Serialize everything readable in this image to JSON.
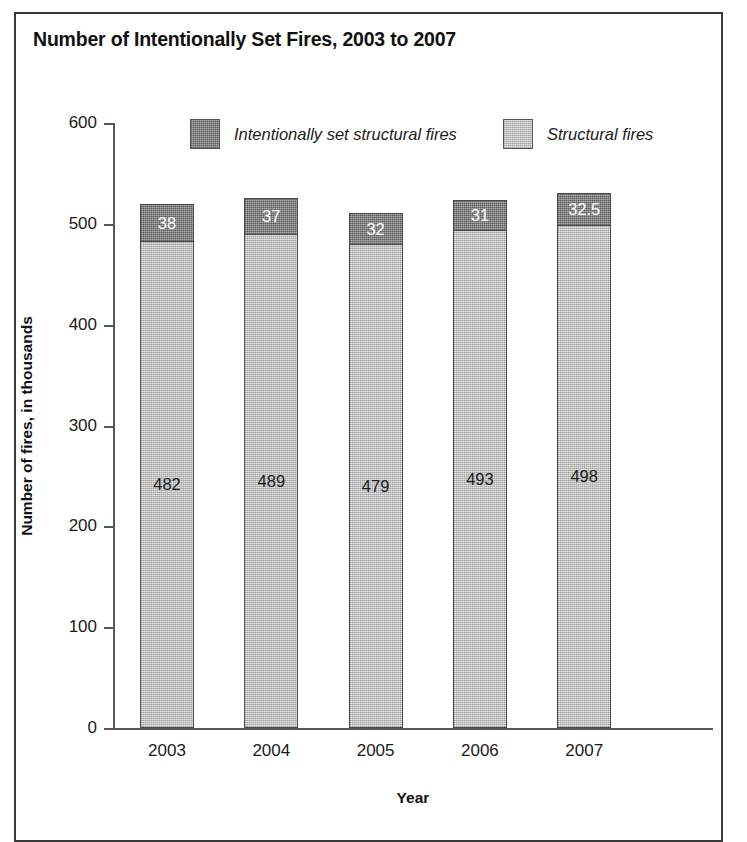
{
  "chart_data": {
    "type": "bar",
    "subtype": "stacked-bar",
    "title": "Number of Intentionally Set Fires, 2003 to 2007",
    "xlabel": "Year",
    "ylabel": "Number of fires, in thousands",
    "categories": [
      "2003",
      "2004",
      "2005",
      "2006",
      "2007"
    ],
    "ylim": [
      0,
      600
    ],
    "yticks": [
      0,
      100,
      200,
      300,
      400,
      500,
      600
    ],
    "ytick_labels": [
      "0",
      "100",
      "200",
      "300",
      "400",
      "500",
      "600"
    ],
    "grid": false,
    "legend_position": "top-inside",
    "series": [
      {
        "name": "Structural fires",
        "values": [
          482,
          489,
          479,
          493,
          498
        ],
        "value_labels": [
          "482",
          "489",
          "479",
          "493",
          "498"
        ],
        "color": "#cacaca",
        "label_color": "#1b1b1b",
        "stack_order": 0
      },
      {
        "name": "Intentionally set structural fires",
        "values": [
          38,
          37,
          32,
          31,
          32.5
        ],
        "value_labels": [
          "38",
          "37",
          "32",
          "31",
          "32.5"
        ],
        "color": "#8d8d8d",
        "label_color": "#ffffff",
        "stack_order": 1
      }
    ],
    "totals": [
      520,
      526,
      511,
      524,
      530.5
    ],
    "legend": [
      {
        "label": "Intentionally set structural fires",
        "color": "#8d8d8d"
      },
      {
        "label": "Structural fires",
        "color": "#cacaca"
      }
    ]
  },
  "style": {
    "frame_color": "#3a3a3a",
    "axis_color": "#575757",
    "text_color": "#1b1b1b",
    "bar_border_color": "#4a4a4a",
    "background": "#ffffff"
  }
}
